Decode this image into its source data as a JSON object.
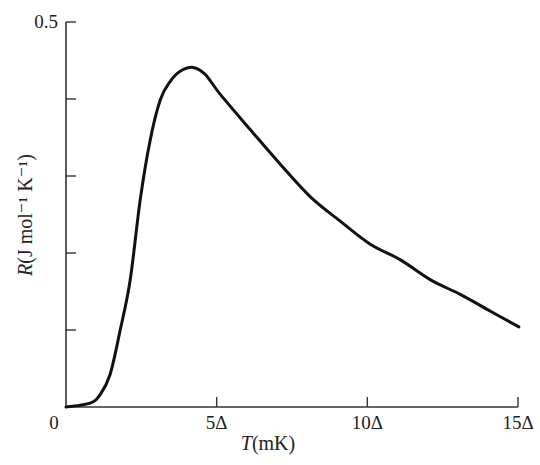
{
  "chart_data": {
    "type": "line",
    "title": "",
    "xlabel": "T(mK)",
    "ylabel": "R(J mol⁻¹ K⁻¹)",
    "xlabel_parts": {
      "var": "T",
      "unit": "(mK)"
    },
    "ylabel_parts": {
      "var": "R",
      "unit": "(J mol⁻¹ K⁻¹)"
    },
    "x_unit": "Δ",
    "xlim": [
      0,
      15
    ],
    "ylim": [
      0,
      0.5
    ],
    "x_ticks": [
      0,
      5,
      10,
      15
    ],
    "x_tick_labels": [
      "0",
      "5Δ",
      "10Δ",
      "15Δ"
    ],
    "y_ticks": [
      0,
      0.1,
      0.2,
      0.3,
      0.4,
      0.5
    ],
    "y_tick_labels": [
      "",
      "",
      "",
      "",
      "",
      "0.5"
    ],
    "grid": false,
    "legend": null,
    "series": [
      {
        "name": "R",
        "x": [
          0,
          0.8,
          1.13,
          1.46,
          1.8,
          2.13,
          2.46,
          2.79,
          3.13,
          3.46,
          3.79,
          4.22,
          4.62,
          5.12,
          6.12,
          7.12,
          8.11,
          9.11,
          10.11,
          11.1,
          12.1,
          13.1,
          14.1,
          15.03
        ],
        "values": [
          0.0,
          0.005,
          0.016,
          0.042,
          0.1,
          0.165,
          0.268,
          0.346,
          0.399,
          0.423,
          0.436,
          0.441,
          0.432,
          0.406,
          0.36,
          0.315,
          0.273,
          0.241,
          0.211,
          0.191,
          0.165,
          0.146,
          0.124,
          0.104
        ]
      }
    ],
    "peak": {
      "x": 4.2,
      "y": 0.44
    }
  }
}
